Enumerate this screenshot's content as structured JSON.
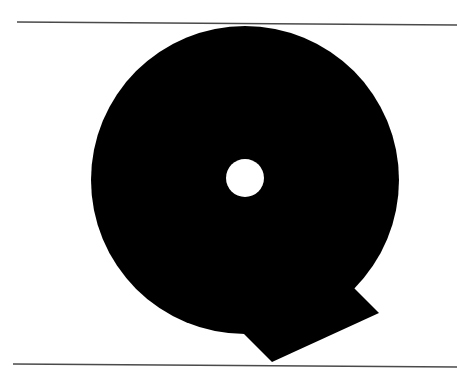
{
  "figure": {
    "letter": "Q",
    "colors": {
      "background": "#ffffff",
      "glyph": "#000000",
      "hole": "#ffffff",
      "rule": "#4a4a4a"
    }
  }
}
